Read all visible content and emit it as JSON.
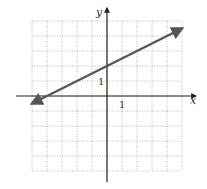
{
  "chart_data": {
    "type": "line",
    "title": "",
    "xlabel": "x",
    "ylabel": "y",
    "xlim": [
      -5,
      5
    ],
    "ylim": [
      -5,
      5
    ],
    "grid": true,
    "tick_labels": {
      "x": "1",
      "y": "1"
    },
    "series": [
      {
        "name": "line",
        "equation": "y = 0.5x + 2",
        "slope": 0.5,
        "y_intercept": 2,
        "x_intercept": -4,
        "x": [
          -5,
          5
        ],
        "y": [
          -0.5,
          4.5
        ],
        "arrows": "both",
        "color": "#555555"
      }
    ]
  },
  "axes": {
    "x_label": "x",
    "y_label": "y",
    "x_tick": "1",
    "y_tick": "1"
  }
}
